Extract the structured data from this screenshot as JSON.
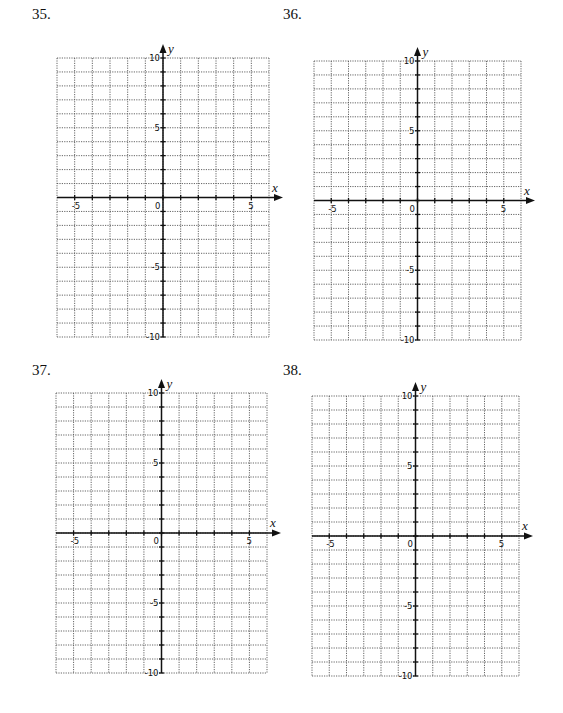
{
  "axes_config": {
    "x_min": -6,
    "x_max": 6,
    "y_min": -10,
    "y_max": 10,
    "x_tick_labels": [
      "-5",
      "0",
      "5"
    ],
    "x_tick_label_values": [
      -5,
      0,
      5
    ],
    "y_tick_labels": [
      "10",
      "5",
      "-5",
      "-10"
    ],
    "y_tick_label_values": [
      10,
      5,
      -5,
      -10
    ],
    "x_axis_label": "x",
    "y_axis_label": "y",
    "grid": "dotted, 1 unit per cell"
  },
  "problems": [
    {
      "number": "35.",
      "label_pos": [
        32,
        6
      ],
      "grid_box": [
        57,
        58,
        269,
        337
      ]
    },
    {
      "number": "36.",
      "label_pos": [
        283,
        6
      ],
      "grid_box": [
        314,
        61,
        521,
        340
      ]
    },
    {
      "number": "37.",
      "label_pos": [
        32,
        362
      ],
      "grid_box": [
        56,
        393,
        267,
        673
      ]
    },
    {
      "number": "38.",
      "label_pos": [
        283,
        362
      ],
      "grid_box": [
        312,
        396,
        519,
        676
      ]
    }
  ],
  "chart_data": [
    {
      "type": "scatter",
      "title": "35.",
      "xlabel": "x",
      "ylabel": "y",
      "xlim": [
        -6,
        6
      ],
      "ylim": [
        -10,
        10
      ],
      "grid": true,
      "x_ticks": [
        -5,
        0,
        5
      ],
      "y_ticks": [
        -10,
        -5,
        5,
        10
      ],
      "series": []
    },
    {
      "type": "scatter",
      "title": "36.",
      "xlabel": "x",
      "ylabel": "y",
      "xlim": [
        -6,
        6
      ],
      "ylim": [
        -10,
        10
      ],
      "grid": true,
      "x_ticks": [
        -5,
        0,
        5
      ],
      "y_ticks": [
        -10,
        -5,
        5,
        10
      ],
      "series": []
    },
    {
      "type": "scatter",
      "title": "37.",
      "xlabel": "x",
      "ylabel": "y",
      "xlim": [
        -6,
        6
      ],
      "ylim": [
        -10,
        10
      ],
      "grid": true,
      "x_ticks": [
        -5,
        0,
        5
      ],
      "y_ticks": [
        -10,
        -5,
        5,
        10
      ],
      "series": []
    },
    {
      "type": "scatter",
      "title": "38.",
      "xlabel": "x",
      "ylabel": "y",
      "xlim": [
        -6,
        6
      ],
      "ylim": [
        -10,
        10
      ],
      "grid": true,
      "x_ticks": [
        -5,
        0,
        5
      ],
      "y_ticks": [
        -10,
        -5,
        5,
        10
      ],
      "series": []
    }
  ]
}
